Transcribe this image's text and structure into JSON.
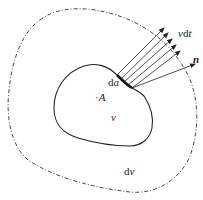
{
  "diagram": {
    "type": "control-volume-flux",
    "colors": {
      "stroke": "#222222",
      "background": "#ffffff"
    },
    "labels": {
      "da": "da",
      "A": "A",
      "A_dot": "·",
      "v": "v",
      "dv": "dv",
      "vdt": "vdt",
      "n": "n"
    },
    "elements": {
      "inner_region": "solid closed boundary of volume v",
      "outer_region": "dash-dot closed boundary of region dv",
      "surface_element": "da (thick segment on inner boundary)",
      "flux_arrows": 5,
      "normal_vector": "n"
    }
  }
}
